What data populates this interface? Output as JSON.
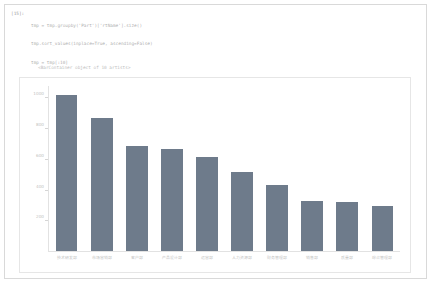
{
  "notebook": {
    "cell": {
      "prompt": "[15]:",
      "code_lines": [
        "tmp = tmp.groupby('Part')['rtName'].size()",
        "tmp.sort_values(inplace=True, ascending=False)",
        "tmp = tmp[:10]",
        "x = tmp.index",
        "y = tmp.values",
        "plt.figure(figsize=(12, 5))",
        "plt.bar(x, y)"
      ],
      "text_output": "<BarContainer object of 10 artists>"
    }
  },
  "chart_data": {
    "type": "bar",
    "title": "",
    "xlabel": "",
    "ylabel": "",
    "categories": [
      "技术研发部",
      "市场营销部",
      "客户部",
      "产品设计部",
      "运营部",
      "人力资源部",
      "财务管理部",
      "销售部",
      "质量部",
      "综合管理部"
    ],
    "values": [
      1020,
      870,
      690,
      665,
      615,
      520,
      430,
      330,
      318,
      295
    ],
    "yticks": [
      200,
      400,
      600,
      800,
      1000
    ],
    "ylim": [
      0,
      1080
    ],
    "grid": false,
    "legend": null,
    "bar_color": "#6e7b8b"
  }
}
